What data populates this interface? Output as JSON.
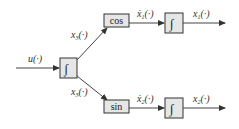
{
  "diagram": {
    "type": "block-diagram",
    "colors": {
      "block_fill": "#e6e6e6",
      "block_stroke": "#333333",
      "line": "#444444",
      "text": "#333333"
    },
    "input": {
      "label": "u(·)"
    },
    "blocks": {
      "main_integrator": {
        "symbol": "∫"
      },
      "cos_block": {
        "label": "cos"
      },
      "sin_block": {
        "label": "sin"
      },
      "top_integrator": {
        "symbol": "∫"
      },
      "bottom_integrator": {
        "symbol": "∫"
      }
    },
    "signals": {
      "x3_upper": {
        "base": "x",
        "sub": "3",
        "tail": "(·)"
      },
      "x3_lower": {
        "base": "x",
        "sub": "3",
        "tail": "(·)"
      },
      "x1_dot": {
        "base": "ẋ",
        "sub": "1",
        "tail": "(·)"
      },
      "x2_dot": {
        "base": "ẋ",
        "sub": "2",
        "tail": "(·)"
      },
      "x1": {
        "base": "x",
        "sub": "1",
        "tail": "(·)"
      },
      "x2": {
        "base": "x",
        "sub": "2",
        "tail": "(·)"
      }
    }
  }
}
